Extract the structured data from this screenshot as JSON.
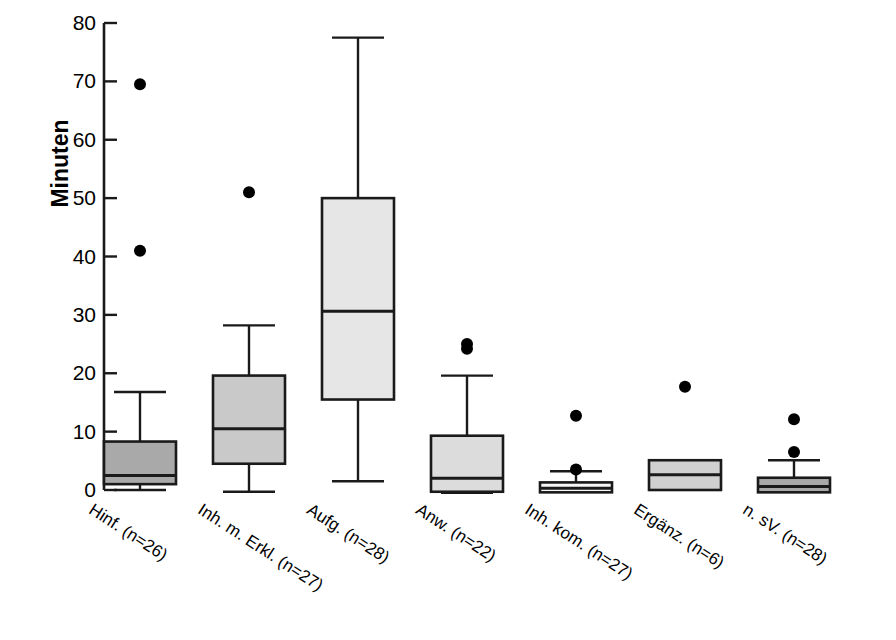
{
  "chart_data": {
    "type": "box",
    "title": "",
    "xlabel": "",
    "ylabel": "Minuten",
    "ylim": [
      0,
      80
    ],
    "ytick_labels": [
      "80",
      "70",
      "60",
      "50",
      "40",
      "30",
      "20",
      "10",
      "0"
    ],
    "ytick_values": [
      80,
      70,
      60,
      50,
      40,
      30,
      20,
      10,
      0
    ],
    "grid": false,
    "legend": "none",
    "categories": [
      "Hinf. (n=26)",
      "Inh. m. Erkl. (n=27)",
      "Aufg. (n=28)",
      "Anw. (n=22)",
      "Inh. kom. (n=27)",
      "Ergänz. (n=6)",
      "n. sV. (n=28)"
    ],
    "boxes": [
      {
        "label": "Hinf. (n=26)",
        "n": 26,
        "whisker_low": 0.0,
        "q1": 1.0,
        "median": 2.5,
        "q3": 8.3,
        "whisker_high": 16.8,
        "outliers": [
          41.0,
          69.5
        ],
        "fill": "#a9a9a9"
      },
      {
        "label": "Inh. m. Erkl. (n=27)",
        "n": 27,
        "whisker_low": -0.3,
        "q1": 4.5,
        "median": 10.5,
        "q3": 19.6,
        "whisker_high": 28.2,
        "outliers": [
          51.0
        ],
        "fill": "#c9c9c9"
      },
      {
        "label": "Aufg. (n=28)",
        "n": 28,
        "whisker_low": 1.5,
        "q1": 15.5,
        "median": 30.6,
        "q3": 50.0,
        "whisker_high": 77.5,
        "outliers": [],
        "fill": "#e6e6e6"
      },
      {
        "label": "Anw. (n=22)",
        "n": 22,
        "whisker_low": -0.5,
        "q1": -0.3,
        "median": 2.0,
        "q3": 9.3,
        "whisker_high": 19.6,
        "outliers": [
          24.2,
          25.0
        ],
        "fill": "#dcdcdc"
      },
      {
        "label": "Inh. kom. (n=27)",
        "n": 27,
        "whisker_low": -0.4,
        "q1": -0.4,
        "median": 0.3,
        "q3": 1.3,
        "whisker_high": 3.2,
        "outliers": [
          3.5,
          12.7
        ],
        "fill": "#f7f7f7"
      },
      {
        "label": "Ergänz. (n=6)",
        "n": 6,
        "whisker_low": 0.0,
        "q1": 0.0,
        "median": 2.6,
        "q3": 5.1,
        "whisker_high": 5.1,
        "outliers": [
          17.7
        ],
        "fill": "#d0d0d0"
      },
      {
        "label": "n. sV. (n=28)",
        "n": 28,
        "whisker_low": -0.4,
        "q1": -0.4,
        "median": 0.6,
        "q3": 2.1,
        "whisker_high": 5.1,
        "outliers": [
          6.5,
          12.1
        ],
        "fill": "#a9a9a9"
      }
    ],
    "colors": {
      "line": "#1a1a1a",
      "outlier": "#000000",
      "background": "#ffffff",
      "text": "#000000"
    }
  }
}
